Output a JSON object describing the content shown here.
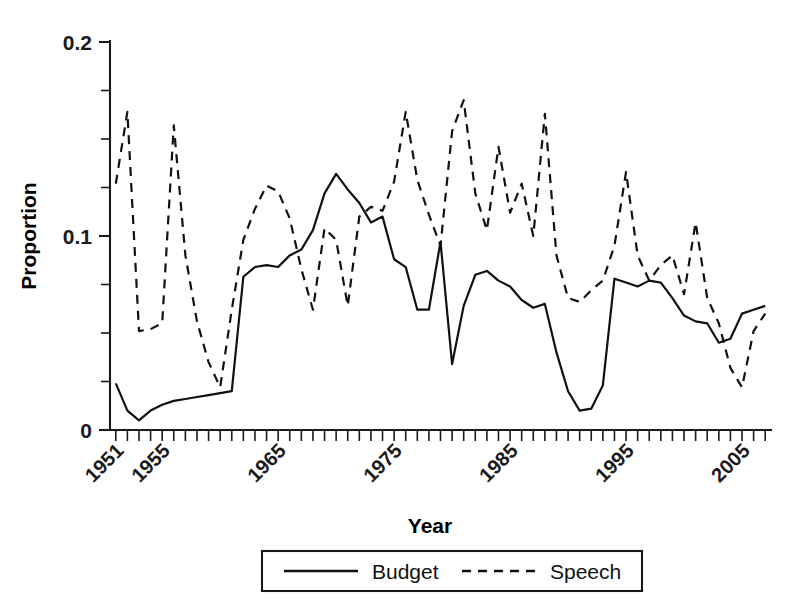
{
  "chart_data": {
    "type": "line",
    "title": "",
    "xlabel": "Year",
    "ylabel": "Proportion",
    "xlim": [
      1950.5,
      2007.5
    ],
    "ylim": [
      0,
      0.2
    ],
    "grid": false,
    "legend_position": "bottom-outside",
    "y_ticks_major": [
      0,
      0.1,
      0.2
    ],
    "y_tick_labels": [
      "0",
      "0.1",
      "0.2"
    ],
    "y_ticks_minor": [
      0.025,
      0.05,
      0.075,
      0.125,
      0.15,
      0.175
    ],
    "x_tick_labels": [
      "1951",
      "1955",
      "1965",
      "1975",
      "1985",
      "1995",
      "2005"
    ],
    "x_tick_label_values": [
      1951,
      1955,
      1965,
      1975,
      1985,
      1995,
      2005
    ],
    "x_minor_tick_step": 1,
    "x": [
      1951,
      1952,
      1953,
      1954,
      1955,
      1956,
      1957,
      1958,
      1959,
      1960,
      1961,
      1962,
      1963,
      1964,
      1965,
      1966,
      1967,
      1968,
      1969,
      1970,
      1971,
      1972,
      1973,
      1974,
      1975,
      1976,
      1977,
      1978,
      1979,
      1980,
      1981,
      1982,
      1983,
      1984,
      1985,
      1986,
      1987,
      1988,
      1989,
      1990,
      1991,
      1992,
      1993,
      1994,
      1995,
      1996,
      1997,
      1998,
      1999,
      2000,
      2001,
      2002,
      2003,
      2004,
      2005,
      2006,
      2007
    ],
    "series": [
      {
        "name": "Budget",
        "style": "solid",
        "values": [
          0.024,
          0.01,
          0.005,
          0.01,
          0.013,
          0.015,
          0.016,
          0.017,
          0.018,
          0.019,
          0.02,
          0.079,
          0.084,
          0.085,
          0.084,
          0.09,
          0.093,
          0.103,
          0.122,
          0.132,
          0.124,
          0.117,
          0.107,
          0.11,
          0.088,
          0.084,
          0.062,
          0.062,
          0.097,
          0.034,
          0.064,
          0.08,
          0.082,
          0.077,
          0.074,
          0.067,
          0.063,
          0.065,
          0.04,
          0.02,
          0.01,
          0.011,
          0.023,
          0.078,
          0.076,
          0.074,
          0.077,
          0.076,
          0.068,
          0.059,
          0.056,
          0.055,
          0.045,
          0.047,
          0.06,
          0.062,
          0.064
        ]
      },
      {
        "name": "Speech",
        "style": "dashed",
        "values": [
          0.127,
          0.164,
          0.051,
          0.052,
          0.055,
          0.157,
          0.09,
          0.056,
          0.035,
          0.022,
          0.062,
          0.098,
          0.114,
          0.126,
          0.123,
          0.109,
          0.083,
          0.062,
          0.104,
          0.098,
          0.064,
          0.11,
          0.115,
          0.113,
          0.128,
          0.164,
          0.129,
          0.111,
          0.095,
          0.154,
          0.17,
          0.122,
          0.103,
          0.146,
          0.112,
          0.127,
          0.1,
          0.163,
          0.09,
          0.068,
          0.066,
          0.072,
          0.077,
          0.095,
          0.133,
          0.09,
          0.077,
          0.085,
          0.09,
          0.07,
          0.107,
          0.068,
          0.055,
          0.032,
          0.022,
          0.051,
          0.06
        ]
      }
    ]
  },
  "legend": {
    "items": [
      {
        "label": "Budget",
        "style": "solid"
      },
      {
        "label": "Speech",
        "style": "dashed"
      }
    ]
  },
  "axes": {
    "y_title": "Proportion",
    "x_title": "Year"
  }
}
